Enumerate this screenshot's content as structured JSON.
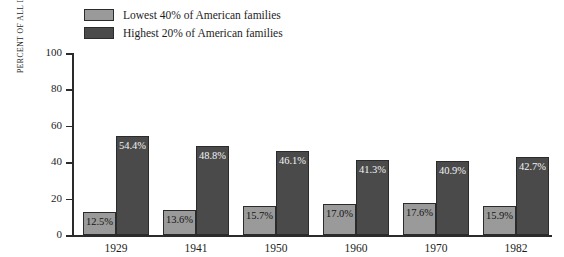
{
  "chart_data": {
    "type": "bar",
    "title": "",
    "xlabel": "",
    "ylabel": "PERCENT OF ALL INCOME RECEIVED",
    "ylim": [
      0,
      100
    ],
    "yticks": [
      0,
      20,
      40,
      60,
      80,
      100
    ],
    "ytick_labels": [
      "0",
      "20",
      "40",
      "60",
      "80",
      "100"
    ],
    "grid": false,
    "legend_position": "top-left",
    "categories": [
      "1929",
      "1941",
      "1950",
      "1960",
      "1970",
      "1982"
    ],
    "series": [
      {
        "name": "Lowest 40% of American families",
        "color": "#9a9a9a",
        "values": [
          12.5,
          13.6,
          15.7,
          17.0,
          17.6,
          15.9
        ],
        "labels": [
          "12.5%",
          "13.6%",
          "15.7%",
          "17.0%",
          "17.6%",
          "15.9%"
        ]
      },
      {
        "name": "Highest 20% of American families",
        "color": "#4a4a4a",
        "values": [
          54.4,
          48.8,
          46.1,
          41.3,
          40.9,
          42.7
        ],
        "labels": [
          "54.4%",
          "48.8%",
          "46.1%",
          "41.3%",
          "40.9%",
          "42.7%"
        ]
      }
    ]
  },
  "legend": {
    "items": [
      {
        "label": "Lowest 40% of American families",
        "color": "#9a9a9a"
      },
      {
        "label": "Highest 20% of American families",
        "color": "#4a4a4a"
      }
    ]
  }
}
